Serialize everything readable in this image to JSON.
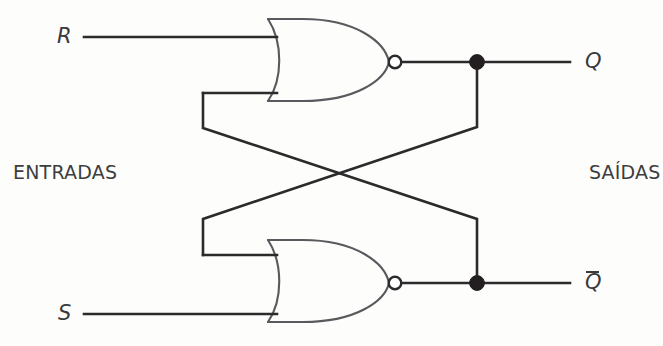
{
  "figure": {
    "background_color": "#fdfdfc",
    "wire_color": "#2b2b2b",
    "gate_outline_color": "#5a5a5e",
    "junction_color": "#231f20"
  },
  "labels": {
    "input_group": "ENTRADAS",
    "output_group": "SAÍDAS",
    "input_r": "R",
    "input_s": "S",
    "output_q": "Q",
    "output_qbar": "Q",
    "output_qbar_overline": true
  },
  "gates": [
    {
      "id": "nor-top",
      "type": "NOR",
      "inputs": [
        "R",
        "feedback-from-Qbar"
      ],
      "output": "Q"
    },
    {
      "id": "nor-bottom",
      "type": "NOR",
      "inputs": [
        "feedback-from-Q",
        "S"
      ],
      "output": "Qbar"
    }
  ],
  "junctions": [
    {
      "id": "junction-q",
      "signal": "Q",
      "x": 477,
      "y": 62
    },
    {
      "id": "junction-qbar",
      "signal": "Qbar",
      "x": 477,
      "y": 283
    }
  ],
  "bubbles": [
    {
      "id": "bubble-top",
      "x": 395,
      "y": 62
    },
    {
      "id": "bubble-bottom",
      "x": 395,
      "y": 283
    }
  ]
}
